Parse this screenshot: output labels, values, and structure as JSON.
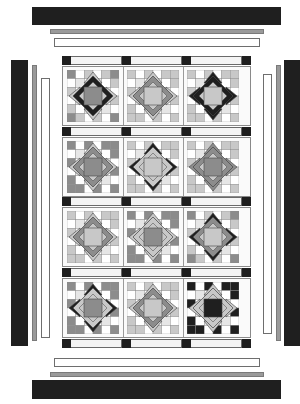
{
  "colors": {
    "dark": "#1f1f1f",
    "mid": "#8c8c8c",
    "light": "#c8c8c8",
    "pale": "#e6e6e6",
    "white": "#ffffff",
    "line": "#444444"
  },
  "borders": {
    "outer": "dark",
    "middle": "gray",
    "inner": "white"
  },
  "layout": {
    "rows": 4,
    "cols": 3,
    "sashing_corner_color": "dark"
  },
  "blocks": [
    {
      "row": 1,
      "col": 1,
      "corners": "mid",
      "center": "mid",
      "ring": "dark",
      "points": "light",
      "grid": "light"
    },
    {
      "row": 1,
      "col": 2,
      "corners": "light",
      "center": "light",
      "ring": "mid",
      "points": "light",
      "grid": "light"
    },
    {
      "row": 1,
      "col": 3,
      "corners": "light",
      "center": "light",
      "ring": "dark",
      "points": "dark",
      "grid": "light"
    },
    {
      "row": 2,
      "col": 1,
      "corners": "mid",
      "center": "mid",
      "ring": "mid",
      "points": "light",
      "grid": "mid"
    },
    {
      "row": 2,
      "col": 2,
      "corners": "light",
      "center": "light",
      "ring": "light",
      "points": "dark",
      "grid": "light"
    },
    {
      "row": 2,
      "col": 3,
      "corners": "light",
      "center": "mid",
      "ring": "mid",
      "points": "mid",
      "grid": "light"
    },
    {
      "row": 3,
      "col": 1,
      "corners": "light",
      "center": "light",
      "ring": "mid",
      "points": "light",
      "grid": "light"
    },
    {
      "row": 3,
      "col": 2,
      "corners": "mid",
      "center": "mid",
      "ring": "light",
      "points": "light",
      "grid": "mid"
    },
    {
      "row": 3,
      "col": 3,
      "corners": "mid",
      "center": "light",
      "ring": "mid",
      "points": "dark",
      "grid": "light"
    },
    {
      "row": 4,
      "col": 1,
      "corners": "mid",
      "center": "mid",
      "ring": "light",
      "points": "dark",
      "grid": "mid"
    },
    {
      "row": 4,
      "col": 2,
      "corners": "light",
      "center": "light",
      "ring": "mid",
      "points": "light",
      "grid": "light"
    },
    {
      "row": 4,
      "col": 3,
      "corners": "dark",
      "center": "dark",
      "ring": "light",
      "points": "light",
      "grid": "dark"
    }
  ]
}
